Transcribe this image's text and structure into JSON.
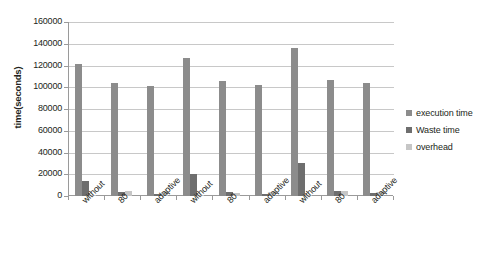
{
  "chart_data": {
    "type": "bar",
    "title": "",
    "xlabel": "",
    "ylabel": "time(seconds)",
    "ylim": [
      0,
      160000
    ],
    "ytick_step": 20000,
    "yticks": [
      0,
      20000,
      40000,
      60000,
      80000,
      100000,
      120000,
      140000,
      160000
    ],
    "ytick_labels": [
      "0",
      "20000",
      "40000",
      "60000",
      "80000",
      "100000",
      "120000",
      "140000",
      "160000"
    ],
    "grid": true,
    "legend_position": "right",
    "categories": [
      "without",
      "80",
      "adaptive",
      "without",
      "80",
      "adaptive",
      "without",
      "80",
      "adaptive"
    ],
    "groups": [
      {
        "name": "group-1",
        "categories": [
          "without",
          "80",
          "adaptive"
        ]
      },
      {
        "name": "group-2",
        "categories": [
          "without",
          "80",
          "adaptive"
        ]
      },
      {
        "name": "group-3",
        "categories": [
          "without",
          "80",
          "adaptive"
        ]
      }
    ],
    "series": [
      {
        "name": "execution time",
        "color": "#8c8c8c",
        "values": [
          121000,
          104000,
          101000,
          127000,
          105500,
          102000,
          136500,
          106500,
          104000
        ]
      },
      {
        "name": "Waste time",
        "color": "#6e6e6e",
        "values": [
          14000,
          3500,
          2000,
          20000,
          4000,
          1500,
          30500,
          4500,
          2500
        ]
      },
      {
        "name": "overhead",
        "color": "#c6c6c6",
        "values": [
          600,
          4500,
          3500,
          500,
          2500,
          3500,
          700,
          4500,
          3500
        ]
      }
    ]
  },
  "legend": {
    "items": [
      {
        "label": "execution time",
        "color": "#8c8c8c"
      },
      {
        "label": "Waste time",
        "color": "#6e6e6e"
      },
      {
        "label": "overhead",
        "color": "#c6c6c6"
      }
    ]
  },
  "axis": {
    "y_title": "time(seconds)"
  }
}
